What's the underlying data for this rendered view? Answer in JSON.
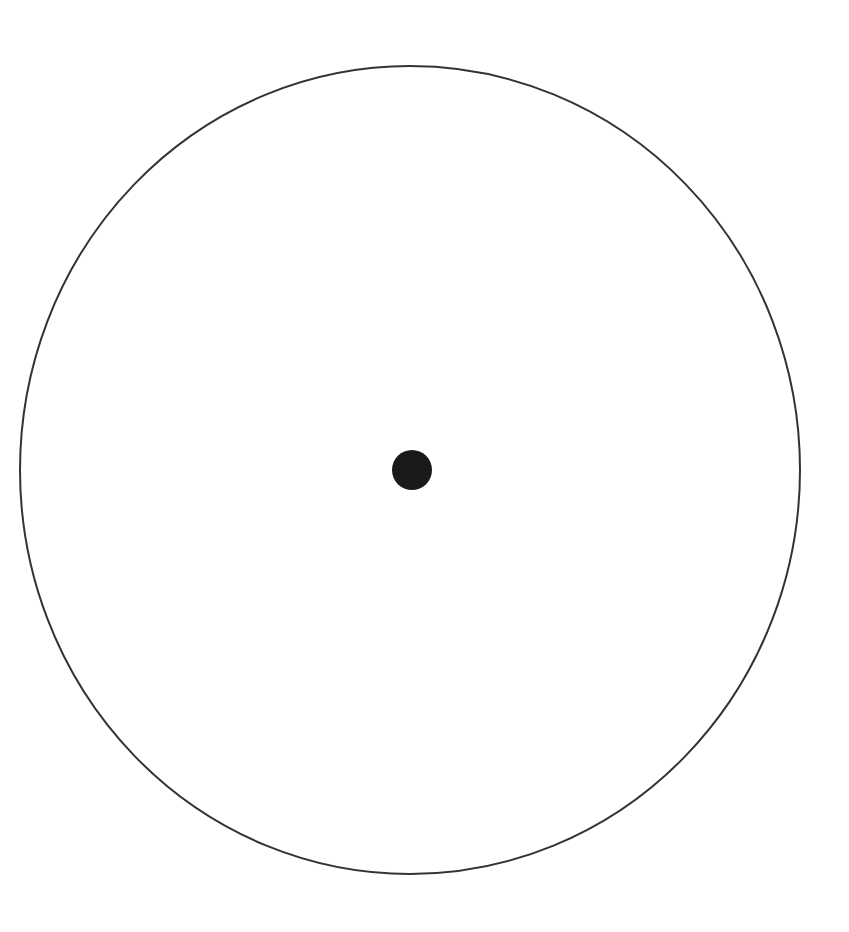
{
  "diagram": {
    "background": "#ffffff",
    "outer_circle": {
      "cx": 410,
      "cy": 470,
      "rx": 390,
      "ry": 404,
      "stroke": "#333333",
      "stroke_width": 2,
      "fill": "none"
    },
    "center_dot": {
      "cx": 412,
      "cy": 470,
      "r": 20,
      "fill": "#1a1a1a"
    }
  }
}
